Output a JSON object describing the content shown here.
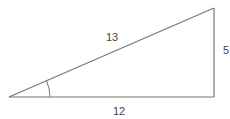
{
  "diagram": {
    "type": "right-triangle",
    "sides": {
      "hypotenuse": "13",
      "opposite": "5",
      "adjacent": "12"
    },
    "angle_marker": "arc at left vertex",
    "colors": {
      "stroke": "#777777",
      "text": "#444444"
    }
  }
}
